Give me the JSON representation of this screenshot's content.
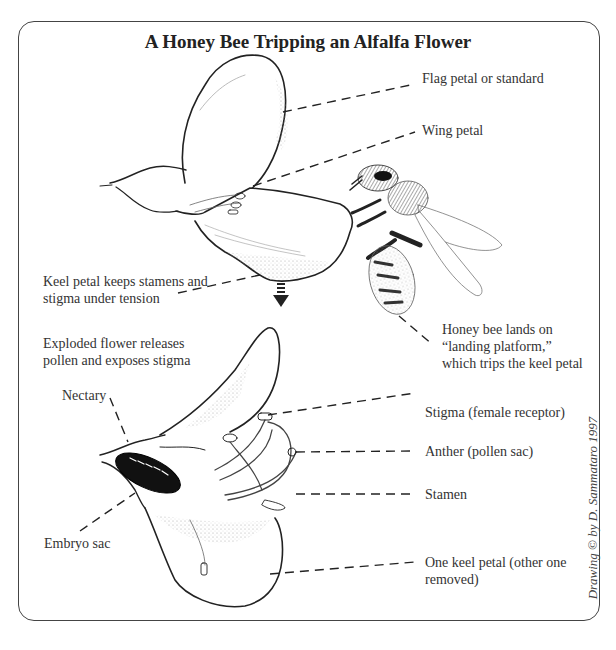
{
  "title": "A Honey Bee Tripping an Alfalfa Flower",
  "labels": {
    "flag_petal": "Flag petal or standard",
    "wing_petal": "Wing petal",
    "keel_tension_line1": "Keel petal keeps stamens and",
    "keel_tension_line2": "stigma under tension",
    "bee_line1": "Honey bee lands on",
    "bee_line2": "“landing platform,”",
    "bee_line3": "which trips the keel petal",
    "exploded_line1": "Exploded flower releases",
    "exploded_line2": "pollen and exposes stigma",
    "nectary": "Nectary",
    "stigma": "Stigma (female receptor)",
    "anther": "Anther  (pollen sac)",
    "stamen": "Stamen",
    "embryo_sac": "Embryo sac",
    "one_keel_line1": "One keel petal (other one",
    "one_keel_line2": "removed)"
  },
  "credit": "Drawing © by D. Sammataro 1997",
  "colors": {
    "ink": "#222222",
    "background": "#ffffff",
    "frame": "#444444"
  }
}
